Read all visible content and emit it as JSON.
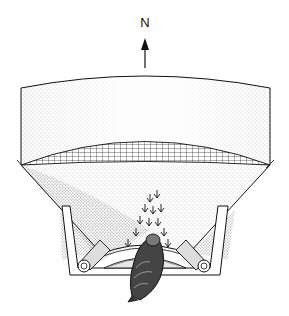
{
  "figure": {
    "compass": {
      "label": "N",
      "direction": "up"
    },
    "elements": [
      "north-arrow",
      "funnel-upper-wall",
      "net-cover",
      "funnel-sloped-wall",
      "ink-pad-tray",
      "rolled-paper-left",
      "rolled-paper-right",
      "bird",
      "footprint-marks"
    ]
  },
  "colors": {
    "ink": "#111111",
    "background": "#ffffff",
    "stipple": "#555555"
  }
}
